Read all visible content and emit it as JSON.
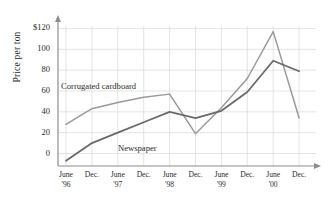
{
  "chart_data": {
    "type": "line",
    "title": "",
    "xlabel": "",
    "ylabel": "Price per ton",
    "ylim": [
      -20,
      130
    ],
    "y_ticks": [
      "0",
      "20",
      "40",
      "60",
      "80",
      "100",
      "$120"
    ],
    "y_tick_values": [
      0,
      20,
      40,
      60,
      80,
      100,
      120
    ],
    "grid": true,
    "legend_position": "inline-annotation",
    "categories": [
      "June '96",
      "Dec.",
      "June '97",
      "Dec.",
      "June '98",
      "Dec.",
      "June '99",
      "Dec.",
      "June '00",
      "Dec."
    ],
    "x_tick_lines": [
      {
        "l1": "June",
        "l2": "'96"
      },
      {
        "l1": "Dec.",
        "l2": ""
      },
      {
        "l1": "June",
        "l2": "'97"
      },
      {
        "l1": "Dec.",
        "l2": ""
      },
      {
        "l1": "June",
        "l2": "'98"
      },
      {
        "l1": "Dec.",
        "l2": ""
      },
      {
        "l1": "June",
        "l2": "'99"
      },
      {
        "l1": "Dec.",
        "l2": ""
      },
      {
        "l1": "June",
        "l2": "'00"
      },
      {
        "l1": "Dec.",
        "l2": ""
      }
    ],
    "series": [
      {
        "name": "Corrugated cardboard",
        "color": "#9a9a9a",
        "values": [
          28,
          43,
          49,
          54,
          57,
          19,
          44,
          72,
          117,
          34
        ]
      },
      {
        "name": "Newspaper",
        "color": "#6a6a6a",
        "values": [
          -7,
          10,
          20,
          30,
          40,
          34,
          41,
          59,
          89,
          79
        ]
      }
    ],
    "annotations": [
      {
        "text": "Corrugated cardboard",
        "target": "cardboard"
      },
      {
        "text": "Newspaper",
        "target": "newspaper"
      }
    ]
  },
  "axis": {
    "y_title": "Price per ton",
    "axis_color": "#8c8c8c",
    "grid_color": "#d8d8d8"
  }
}
